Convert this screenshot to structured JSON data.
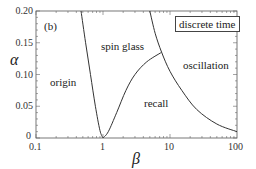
{
  "chart_data": {
    "type": "line",
    "title": "",
    "panel_label": "(b)",
    "xlabel": "β",
    "ylabel": "α",
    "xscale": "log",
    "xlim": [
      0.1,
      100
    ],
    "ylim": [
      0,
      0.2
    ],
    "xticks": [
      "0.1",
      "1",
      "10",
      "100"
    ],
    "yticks": [
      "0",
      "0.05",
      "0.10",
      "0.15",
      "0.20"
    ],
    "legend": "discrete time",
    "regions": [
      "origin",
      "spin glass",
      "recall",
      "oscillation"
    ],
    "series": [
      {
        "name": "origin / spin-glass boundary (left branch)",
        "points": [
          [
            0.47,
            0.2
          ],
          [
            0.55,
            0.15
          ],
          [
            0.65,
            0.1
          ],
          [
            0.77,
            0.05
          ],
          [
            0.9,
            0.012
          ],
          [
            1.0,
            0.0
          ]
        ]
      },
      {
        "name": "recall boundary (right branch to triple point)",
        "points": [
          [
            1.0,
            0.0
          ],
          [
            1.2,
            0.01
          ],
          [
            1.6,
            0.04
          ],
          [
            2.2,
            0.075
          ],
          [
            3.0,
            0.1
          ],
          [
            4.5,
            0.12
          ],
          [
            7.5,
            0.135
          ]
        ]
      },
      {
        "name": "oscillation boundary",
        "points": [
          [
            5.0,
            0.2
          ],
          [
            6.0,
            0.165
          ],
          [
            7.5,
            0.135
          ],
          [
            10,
            0.105
          ],
          [
            15,
            0.075
          ],
          [
            25,
            0.045
          ],
          [
            50,
            0.022
          ],
          [
            100,
            0.01
          ]
        ]
      }
    ],
    "triple_point": [
      7.5,
      0.135
    ],
    "grid": false
  },
  "labels": {
    "panel": "(b)",
    "legend": "discrete time",
    "origin": "origin",
    "spin_glass": "spin glass",
    "recall": "recall",
    "oscillation": "oscillation",
    "xlabel": "β",
    "ylabel": "α",
    "xticks": [
      "0.1",
      "1",
      "10",
      "100"
    ],
    "yticks": [
      "0",
      "0.05",
      "0.10",
      "0.15",
      "0.20"
    ]
  }
}
